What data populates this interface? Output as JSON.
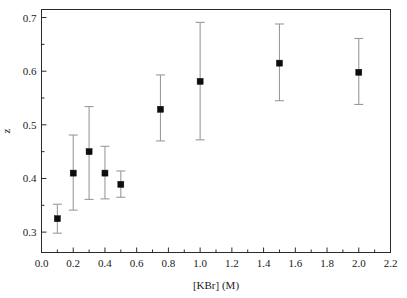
{
  "chart_data": {
    "type": "scatter",
    "title": "",
    "xlabel": "[KBr] (M)",
    "ylabel": "z",
    "xlim": [
      0.0,
      2.2
    ],
    "ylim": [
      0.262,
      0.715
    ],
    "grid": false,
    "legend": null,
    "x_ticks": [
      "0.0",
      "0.2",
      "0.4",
      "0.6",
      "0.8",
      "1.0",
      "1.2",
      "1.4",
      "1.6",
      "1.8",
      "2.0",
      "2.2"
    ],
    "x_tick_values": [
      0.0,
      0.2,
      0.4,
      0.6,
      0.8,
      1.0,
      1.2,
      1.4,
      1.6,
      1.8,
      2.0,
      2.2
    ],
    "x_minor_step": 0.1,
    "y_ticks": [
      "0.3",
      "0.4",
      "0.5",
      "0.6",
      "0.7"
    ],
    "y_tick_values": [
      0.3,
      0.4,
      0.5,
      0.6,
      0.7
    ],
    "y_minor_step": 0.05,
    "marker_style": "filled-square",
    "marker_color": "#0d0d0d",
    "errorbar_color": "#9a9a9a",
    "x": [
      0.1,
      0.2,
      0.3,
      0.4,
      0.5,
      0.75,
      1.0,
      1.5,
      2.0
    ],
    "values": [
      0.325,
      0.41,
      0.45,
      0.41,
      0.389,
      0.529,
      0.581,
      0.615,
      0.598
    ],
    "y_err_low": [
      0.298,
      0.341,
      0.361,
      0.362,
      0.365,
      0.47,
      0.472,
      0.545,
      0.538
    ],
    "y_err_high": [
      0.352,
      0.481,
      0.534,
      0.46,
      0.414,
      0.593,
      0.691,
      0.688,
      0.661
    ],
    "points": [
      {
        "x": 0.1,
        "y": 0.325,
        "low": 0.298,
        "high": 0.352
      },
      {
        "x": 0.2,
        "y": 0.41,
        "low": 0.341,
        "high": 0.481
      },
      {
        "x": 0.3,
        "y": 0.45,
        "low": 0.361,
        "high": 0.534
      },
      {
        "x": 0.4,
        "y": 0.41,
        "low": 0.362,
        "high": 0.46
      },
      {
        "x": 0.5,
        "y": 0.389,
        "low": 0.365,
        "high": 0.414
      },
      {
        "x": 0.75,
        "y": 0.529,
        "low": 0.47,
        "high": 0.593
      },
      {
        "x": 1.0,
        "y": 0.581,
        "low": 0.472,
        "high": 0.691
      },
      {
        "x": 1.5,
        "y": 0.615,
        "low": 0.545,
        "high": 0.688
      },
      {
        "x": 2.0,
        "y": 0.598,
        "low": 0.538,
        "high": 0.661
      }
    ]
  },
  "figure": {
    "background_color": "#ffffff",
    "frame_color": "#2b2b2b",
    "x_axis_title": "[KBr] (M)",
    "y_axis_title": "z"
  }
}
